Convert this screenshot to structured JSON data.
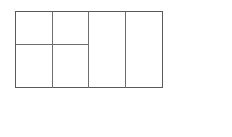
{
  "figure": {
    "name": "rectangle-partition-diagram",
    "outer": {
      "x": 0,
      "y": 0,
      "width": 148,
      "height": 77
    },
    "stroke_color": "#5a5a5a",
    "inner_stroke_color": "#6e6e6e",
    "fill_color": "#ffffff",
    "vertical_lines": [
      37,
      73,
      110
    ],
    "horizontal_lines": [
      {
        "y": 33,
        "x_start": 0,
        "x_end": 73
      }
    ],
    "cell_count": 6
  },
  "answer": {
    "open_paren": "(",
    "close_paren": ")",
    "value": ""
  }
}
